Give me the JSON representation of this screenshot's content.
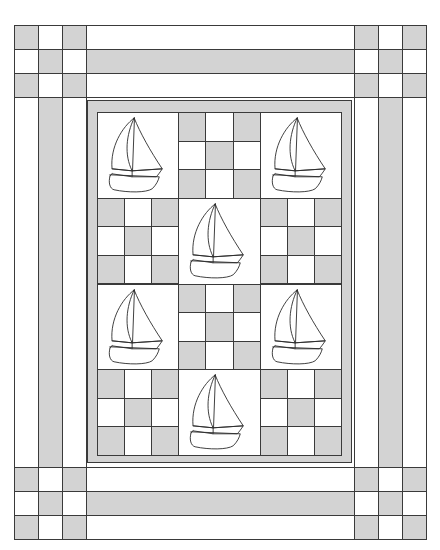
{
  "colors": {
    "fabric_gray": "#d3d3d3",
    "fabric_white": "#ffffff",
    "seam_line": "#3a3a3a",
    "background": "#ffffff"
  },
  "quilt": {
    "outer_border": {
      "left": 14,
      "top": 25,
      "right": 426,
      "bottom": 539,
      "strip_width": 24,
      "strips_order": [
        "white",
        "gray",
        "white"
      ],
      "corner_patches": "nine-patch (gray corners and center)"
    },
    "inner_border": {
      "left": 87,
      "top": 100,
      "right": 352,
      "bottom": 463,
      "color": "gray"
    },
    "center": {
      "left": 97,
      "top": 112,
      "right": 341,
      "bottom": 455,
      "columns": 3,
      "rows": 4,
      "layout": [
        [
          "sailboat",
          "nine-patch",
          "sailboat"
        ],
        [
          "nine-patch",
          "sailboat",
          "nine-patch"
        ],
        [
          "sailboat",
          "nine-patch",
          "sailboat"
        ],
        [
          "nine-patch",
          "sailboat",
          "nine-patch"
        ]
      ],
      "nine_patch_pattern": [
        [
          "gray",
          "white",
          "gray"
        ],
        [
          "white",
          "gray",
          "white"
        ],
        [
          "gray",
          "white",
          "gray"
        ]
      ]
    },
    "block_counts": {
      "sailboat_blocks": 6,
      "nine_patch_blocks": 6,
      "corner_nine_patches": 4
    }
  }
}
